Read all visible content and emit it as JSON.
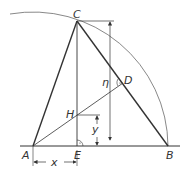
{
  "diagram": {
    "type": "geometry-construction",
    "points": {
      "A": {
        "label": "A",
        "x": 33,
        "y": 146
      },
      "B": {
        "label": "B",
        "x": 168,
        "y": 146
      },
      "C": {
        "label": "C",
        "x": 77,
        "y": 21
      },
      "D": {
        "label": "D",
        "x": 123,
        "y": 83
      },
      "E": {
        "label": "E",
        "x": 77,
        "y": 146
      },
      "H": {
        "label": "H",
        "x": 77,
        "y": 115
      }
    },
    "dimensions": {
      "x": "x",
      "y": "y",
      "eta": "η"
    },
    "colors": {
      "stroke": "#333333",
      "background": "#ffffff"
    }
  }
}
